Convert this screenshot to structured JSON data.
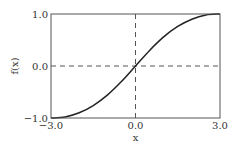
{
  "chart_data": {
    "type": "line",
    "title": "",
    "xlabel": "x",
    "ylabel": "f(x)",
    "xlim": [
      -3.0,
      3.0
    ],
    "ylim": [
      -1.0,
      1.0
    ],
    "x_ticks": [
      "−3.0",
      "0.0",
      "3.0"
    ],
    "y_ticks": [
      "−1.0",
      "0.0",
      "1.0"
    ],
    "grid": false,
    "reference_lines": [
      {
        "orientation": "vertical",
        "value": 0.0,
        "style": "dashed"
      },
      {
        "orientation": "horizontal",
        "value": 0.0,
        "style": "dashed"
      }
    ],
    "series": [
      {
        "name": "f(x)",
        "x": [
          -3.0,
          -2.5,
          -2.0,
          -1.5,
          -1.0,
          -0.5,
          0.0,
          0.5,
          1.0,
          1.5,
          2.0,
          2.5,
          3.0
        ],
        "y": [
          -1.0,
          -0.98,
          -0.9,
          -0.76,
          -0.56,
          -0.3,
          0.0,
          0.3,
          0.56,
          0.76,
          0.9,
          0.98,
          1.0
        ]
      }
    ]
  }
}
